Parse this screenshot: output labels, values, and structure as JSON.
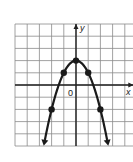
{
  "chart_data": {
    "type": "line",
    "title": "",
    "equation": "y = 2 - x^2",
    "xlabel": "x",
    "ylabel": "y",
    "origin_label": "0",
    "xlim": [
      -5,
      4.7
    ],
    "ylim": [
      -5,
      5
    ],
    "grid": true,
    "grid_step": 1,
    "legend": null,
    "series": [
      {
        "name": "parabola",
        "points": [
          {
            "x": -2,
            "y": -2
          },
          {
            "x": -1,
            "y": 1
          },
          {
            "x": 0,
            "y": 2
          },
          {
            "x": 1,
            "y": 1
          },
          {
            "x": 2,
            "y": -2
          }
        ],
        "arrow_ends": true
      }
    ]
  },
  "colors": {
    "grid": "#8a8a8a",
    "axis": "#222222",
    "curve": "#1a1a1a",
    "background": "#ffffff"
  }
}
